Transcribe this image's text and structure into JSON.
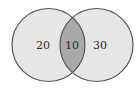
{
  "diagram": {
    "type": "venn",
    "sets": [
      {
        "name": "left-set",
        "only_value": "20"
      },
      {
        "name": "right-set",
        "only_value": "30"
      }
    ],
    "intersection_value": "10",
    "colors": {
      "circle_fill": "#e6e6e6",
      "intersection_fill": "#a9a9a9",
      "stroke": "#555555"
    }
  }
}
